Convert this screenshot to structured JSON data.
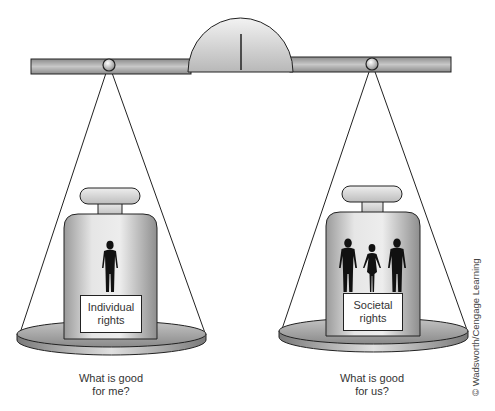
{
  "figure": {
    "type": "balance-scale",
    "left_pan": {
      "weight_label_line1": "Individual",
      "weight_label_line2": "rights",
      "figure_count": 1,
      "caption_line1": "What is good",
      "caption_line2": "for me?"
    },
    "right_pan": {
      "weight_label_line1": "Societal",
      "weight_label_line2": "rights",
      "figure_count": 3,
      "caption_line1": "What is good",
      "caption_line2": "for us?"
    },
    "copyright": "© Wadsworth/Cengage Learning"
  },
  "colors": {
    "outline": "#222222",
    "beam_fill": "#a8a8a8",
    "weight_fill": "#d4d4d4",
    "pan_fill": "#a0a0a0",
    "silhouette": "#111111"
  }
}
